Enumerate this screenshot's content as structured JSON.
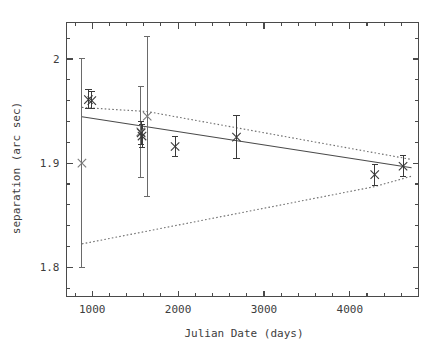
{
  "chart_data": {
    "type": "scatter",
    "title": "",
    "xlabel": "Julian Date (days)",
    "ylabel": "separation (arc sec)",
    "xlim": [
      700,
      4800
    ],
    "ylim": [
      1.772,
      2.035
    ],
    "grid": false,
    "legend": null,
    "x_ticks_major": [
      1000,
      2000,
      3000,
      4000
    ],
    "x_tick_labels": [
      "1000",
      "2000",
      "3000",
      "4000"
    ],
    "x_tick_minor_step": 200,
    "y_ticks_major": [
      1.8,
      1.9,
      2.0
    ],
    "y_tick_labels": [
      "1.8",
      "1.9",
      "2"
    ],
    "y_tick_minor_step": 0.02,
    "marker_symbol": "x",
    "series": [
      {
        "name": "separation measurements",
        "x": [
          880,
          955,
          995,
          1565,
          1570,
          1580,
          1640,
          1965,
          2680,
          4290,
          4620
        ],
        "y": [
          1.9,
          1.961,
          1.96,
          1.93,
          1.929,
          1.926,
          1.945,
          1.916,
          1.925,
          1.889,
          1.897
        ],
        "yerr_low": [
          0.1,
          0.009,
          0.008,
          0.044,
          0.011,
          0.011,
          0.077,
          0.01,
          0.021,
          0.01,
          0.01
        ],
        "yerr_high": [
          0.1,
          0.01,
          0.009,
          0.044,
          0.011,
          0.011,
          0.077,
          0.01,
          0.021,
          0.01,
          0.01
        ],
        "emphasis": [
          "light",
          "dark",
          "dark",
          "light",
          "dark",
          "dark",
          "light",
          "dark",
          "dark",
          "dark",
          "dark"
        ]
      }
    ],
    "fit_line": {
      "name": "best fit",
      "style": "solid",
      "x": [
        880,
        4720
      ],
      "y": [
        1.9445,
        1.8955
      ]
    },
    "confidence_bands": [
      {
        "name": "upper confidence band",
        "style": "dotted",
        "x": [
          880,
          1640,
          4720
        ],
        "y": [
          1.9535,
          1.9495,
          1.9035
        ]
      },
      {
        "name": "lower confidence band",
        "style": "dotted",
        "x": [
          880,
          4290,
          4720
        ],
        "y": [
          1.8225,
          1.8775,
          1.8875
        ]
      }
    ]
  },
  "axes": {
    "x_title": "Julian Date (days)",
    "y_title": "separation (arc sec)"
  }
}
